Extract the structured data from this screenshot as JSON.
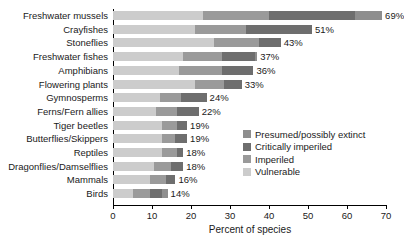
{
  "chart_data": {
    "type": "bar",
    "orientation": "horizontal",
    "stacked": true,
    "title": "",
    "xlabel": "Percent of species",
    "ylabel": "",
    "xlim": [
      0,
      70
    ],
    "xticks": [
      0,
      10,
      20,
      30,
      40,
      50,
      60,
      70
    ],
    "grid": false,
    "legend_position": "inside-right",
    "categories": [
      "Freshwater mussels",
      "Crayfishes",
      "Stoneflies",
      "Freshwater fishes",
      "Amphibians",
      "Flowering plants",
      "Gymnosperms",
      "Ferns/Fern allies",
      "Tiger beetles",
      "Butterflies/Skippers",
      "Reptiles",
      "Dragonflies/Damselflies",
      "Mammals",
      "Birds"
    ],
    "totals": [
      69,
      51,
      43,
      37,
      36,
      33,
      24,
      22,
      19,
      19,
      18,
      18,
      16,
      14
    ],
    "total_labels": [
      "69%",
      "51%",
      "43%",
      "37%",
      "36%",
      "33%",
      "24%",
      "22%",
      "19%",
      "19%",
      "18%",
      "18%",
      "16%",
      "14%"
    ],
    "series": [
      {
        "name": "Vulnerable",
        "color": "#cccccc",
        "values": [
          23.0,
          21.0,
          26.0,
          18.0,
          17.0,
          21.0,
          12.0,
          11.0,
          12.5,
          12.5,
          12.5,
          10.5,
          9.5,
          5.0
        ]
      },
      {
        "name": "Imperiled",
        "color": "#9a9a9a",
        "values": [
          17.0,
          13.0,
          11.5,
          10.0,
          11.0,
          7.5,
          5.5,
          5.5,
          4.0,
          3.5,
          4.0,
          4.5,
          4.0,
          4.5
        ]
      },
      {
        "name": "Critically imperiled",
        "color": "#6e6e6e",
        "values": [
          22.0,
          17.0,
          5.5,
          8.5,
          8.0,
          4.5,
          6.5,
          5.5,
          2.5,
          3.0,
          1.5,
          3.0,
          2.5,
          3.0
        ]
      },
      {
        "name": "Presumed/possibly extinct",
        "color": "#8e8e8e",
        "values": [
          7.0,
          0.0,
          0.0,
          0.5,
          0.0,
          0.0,
          0.0,
          0.0,
          0.0,
          0.0,
          0.0,
          0.0,
          0.0,
          1.5
        ]
      }
    ],
    "legend": [
      {
        "label": "Presumed/possibly extinct",
        "color": "#8e8e8e"
      },
      {
        "label": "Critically imperiled",
        "color": "#6e6e6e"
      },
      {
        "label": "Imperiled",
        "color": "#9a9a9a"
      },
      {
        "label": "Vulnerable",
        "color": "#cccccc"
      }
    ]
  }
}
